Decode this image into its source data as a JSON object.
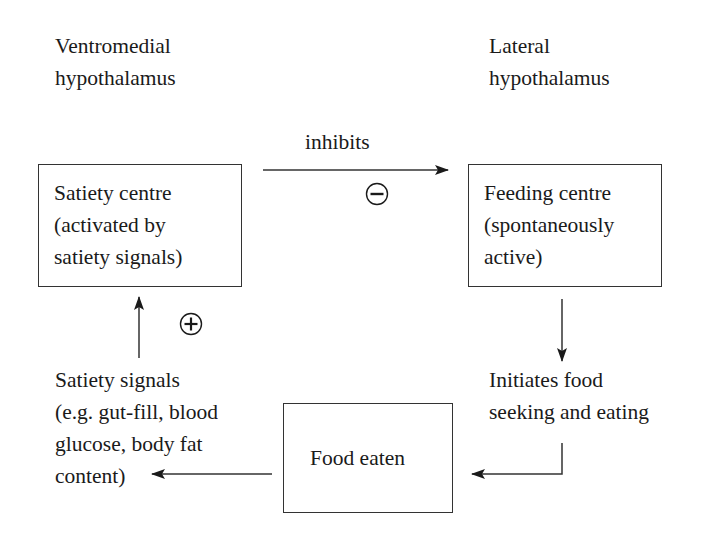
{
  "labels": {
    "left_region": [
      "Ventromedial",
      "hypothalamus"
    ],
    "right_region": [
      "Lateral",
      "hypothalamus"
    ],
    "inhibits": "inhibits"
  },
  "nodes": {
    "satiety_centre": [
      "Satiety centre",
      "(activated by",
      "satiety signals)"
    ],
    "feeding_centre": [
      "Feeding centre",
      "(spontaneously",
      "active)"
    ],
    "initiates": [
      "Initiates food",
      "seeking and eating"
    ],
    "food_eaten": "Food eaten",
    "satiety_signals": [
      "Satiety signals",
      "(e.g. gut-fill, blood",
      "glucose, body fat",
      "content)"
    ]
  },
  "signs": {
    "inhibit_sign": "minus",
    "activate_sign": "plus"
  },
  "edges": [
    {
      "from": "satiety_centre",
      "to": "feeding_centre",
      "label": "inhibits",
      "sign": "minus"
    },
    {
      "from": "feeding_centre",
      "to": "initiates",
      "label": ""
    },
    {
      "from": "initiates",
      "to": "food_eaten",
      "label": ""
    },
    {
      "from": "food_eaten",
      "to": "satiety_signals",
      "label": ""
    },
    {
      "from": "satiety_signals",
      "to": "satiety_centre",
      "label": "",
      "sign": "plus"
    }
  ],
  "colors": {
    "ink": "#1a1a1a",
    "line": "#333333",
    "background": "#ffffff"
  }
}
